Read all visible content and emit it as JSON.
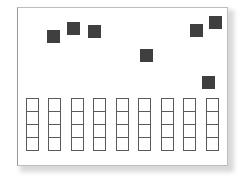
{
  "diagram": {
    "colors": {
      "square": "#3f3f3f",
      "cell_border": "#5a5a5a",
      "frame_border": "#9a9a9a"
    },
    "squares": [
      {
        "x": 47,
        "y": 30
      },
      {
        "x": 67,
        "y": 22
      },
      {
        "x": 88,
        "y": 25
      },
      {
        "x": 140,
        "y": 49
      },
      {
        "x": 190,
        "y": 24
      },
      {
        "x": 209,
        "y": 16
      },
      {
        "x": 202,
        "y": 76
      }
    ],
    "columns": {
      "count": 9,
      "cells_per_column": 4,
      "x": [
        26,
        48,
        71,
        93,
        116,
        138,
        161,
        183,
        206
      ]
    }
  }
}
